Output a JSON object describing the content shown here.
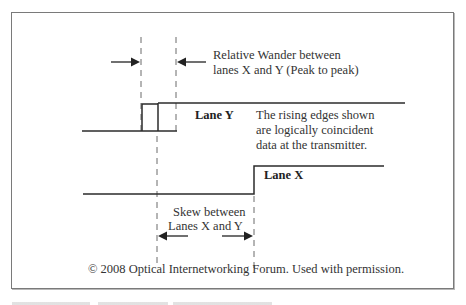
{
  "figure": {
    "annotations": {
      "wander_label_line1": "Relative Wander between",
      "wander_label_line2": "lanes X and Y (Peak to peak)",
      "lane_y_label": "Lane Y",
      "note_line1": "The rising edges shown",
      "note_line2": "are logically coincident",
      "note_line3": "data at the transmitter.",
      "lane_x_label": "Lane X",
      "skew_label_line1": "Skew between",
      "skew_label_line2": "Lanes X and Y"
    },
    "copyright": "© 2008 Optical Internetworking Forum. Used with permission.",
    "colors": {
      "line": "#2b2b2b",
      "dash": "#6a6a6a",
      "frame": "#7a7a7a"
    }
  }
}
